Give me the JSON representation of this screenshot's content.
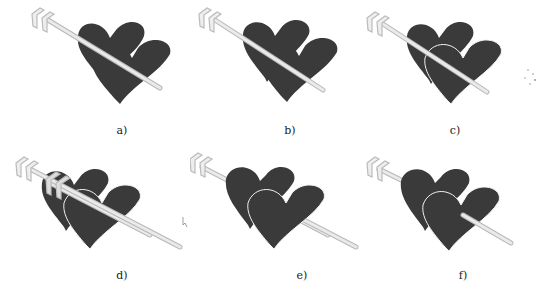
{
  "figure": {
    "panels": [
      {
        "id": "a",
        "caption": "a)",
        "variant": "arrow-in-front"
      },
      {
        "id": "b",
        "caption": "b)",
        "variant": "arrow-in-front-gap"
      },
      {
        "id": "c",
        "caption": "c)",
        "variant": "front-heart-outlined"
      },
      {
        "id": "d",
        "caption": "d)",
        "variant": "duplicate-fletching-on-heart"
      },
      {
        "id": "e",
        "caption": "e)",
        "variant": "arrow-behind-hearts"
      },
      {
        "id": "f",
        "caption": "f)",
        "variant": "arrow-through-front-heart"
      }
    ],
    "colors": {
      "heart_fill": "#3a3a3a",
      "arrow_shaft": "#e8e8e8",
      "arrow_outline": "#b8b8b8",
      "heart_outline": "#f2f2f2",
      "background": "#ffffff"
    }
  }
}
